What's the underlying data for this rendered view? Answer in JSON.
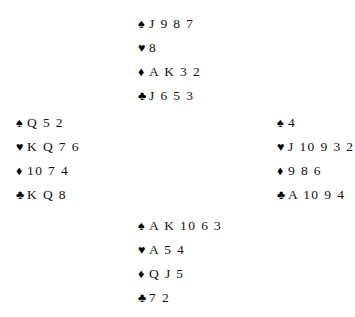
{
  "diagram": {
    "type": "bridge-deal",
    "suit_symbols": {
      "spades": "♠",
      "hearts": "♥",
      "diamonds": "♦",
      "clubs": "♣"
    },
    "suit_color": "#000000",
    "text_color": "#111111",
    "background_color": "#ffffff",
    "hands": {
      "north": {
        "position_label": "North",
        "suits": [
          {
            "suit": "spades",
            "symbol": "♠",
            "cards": "J 9 8 7"
          },
          {
            "suit": "hearts",
            "symbol": "♥",
            "cards": "8"
          },
          {
            "suit": "diamonds",
            "symbol": "♦",
            "cards": "A K 3 2"
          },
          {
            "suit": "clubs",
            "symbol": "♣",
            "cards": "J 6 5 3"
          }
        ]
      },
      "west": {
        "position_label": "West",
        "suits": [
          {
            "suit": "spades",
            "symbol": "♠",
            "cards": "Q 5 2"
          },
          {
            "suit": "hearts",
            "symbol": "♥",
            "cards": "K Q 7 6"
          },
          {
            "suit": "diamonds",
            "symbol": "♦",
            "cards": "10 7 4"
          },
          {
            "suit": "clubs",
            "symbol": "♣",
            "cards": "K Q 8"
          }
        ]
      },
      "east": {
        "position_label": "East",
        "suits": [
          {
            "suit": "spades",
            "symbol": "♠",
            "cards": "4"
          },
          {
            "suit": "hearts",
            "symbol": "♥",
            "cards": "J 10 9 3 2"
          },
          {
            "suit": "diamonds",
            "symbol": "♦",
            "cards": "9 8 6"
          },
          {
            "suit": "clubs",
            "symbol": "♣",
            "cards": "A 10 9 4"
          }
        ]
      },
      "south": {
        "position_label": "South",
        "suits": [
          {
            "suit": "spades",
            "symbol": "♠",
            "cards": "A K 10 6 3"
          },
          {
            "suit": "hearts",
            "symbol": "♥",
            "cards": "A 5 4"
          },
          {
            "suit": "diamonds",
            "symbol": "♦",
            "cards": "Q J 5"
          },
          {
            "suit": "clubs",
            "symbol": "♣",
            "cards": "7 2"
          }
        ]
      }
    }
  }
}
